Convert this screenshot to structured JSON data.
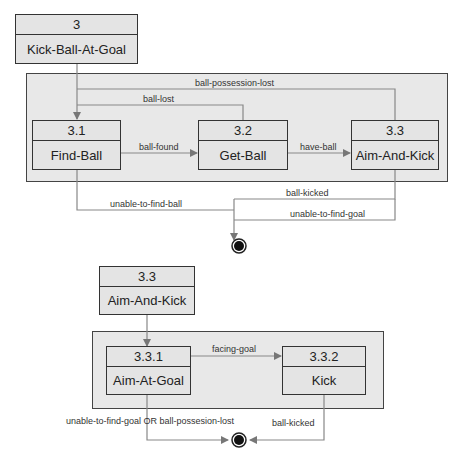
{
  "diagram1": {
    "parent": {
      "id": "3",
      "name": "Kick-Ball-At-Goal"
    },
    "states": [
      {
        "id": "3.1",
        "name": "Find-Ball"
      },
      {
        "id": "3.2",
        "name": "Get-Ball"
      },
      {
        "id": "3.3",
        "name": "Aim-And-Kick"
      }
    ],
    "transitions": {
      "ball_possession_lost": "ball-possession-lost",
      "ball_lost": "ball-lost",
      "ball_found": "ball-found",
      "have_ball": "have-ball",
      "ball_kicked": "ball-kicked",
      "unable_to_find_ball": "unable-to-find-ball",
      "unable_to_find_goal": "unable-to-find-goal"
    }
  },
  "diagram2": {
    "parent": {
      "id": "3.3",
      "name": "Aim-And-Kick"
    },
    "states": [
      {
        "id": "3.3.1",
        "name": "Aim-At-Goal"
      },
      {
        "id": "3.3.2",
        "name": "Kick"
      }
    ],
    "transitions": {
      "facing_goal": "facing-goal",
      "unable_or_lost": "unable-to-find-goal OR ball-possesion-lost",
      "ball_kicked": "ball-kicked"
    }
  },
  "colors": {
    "box_fill": "#e4e4e4",
    "container_fill": "#e8e8e8",
    "line": "#888888",
    "border": "#333333"
  }
}
